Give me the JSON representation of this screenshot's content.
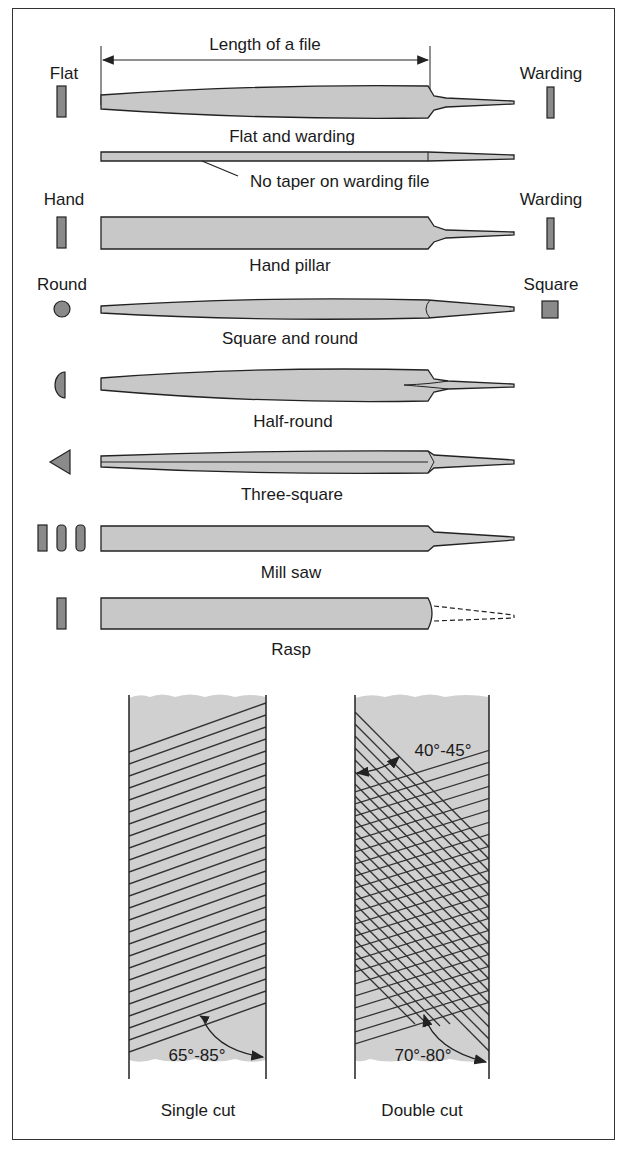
{
  "figure": {
    "title_dimension": "Length of a file",
    "files": [
      {
        "name": "Flat and warding",
        "left_profile": "Flat",
        "right_profile": "Warding"
      },
      {
        "name": "No taper on warding file",
        "annotation": true
      },
      {
        "name": "Hand pillar",
        "left_profile": "Hand",
        "right_profile": "Warding"
      },
      {
        "name": "Square and round",
        "left_profile": "Round",
        "right_profile": "Square"
      },
      {
        "name": "Half-round"
      },
      {
        "name": "Three-square"
      },
      {
        "name": "Mill saw"
      },
      {
        "name": "Rasp"
      }
    ],
    "cuts": [
      {
        "name": "Single cut",
        "angle": "65°-85°"
      },
      {
        "name": "Double cut",
        "angle_top": "40°-45°",
        "angle_bottom": "70°-80°"
      }
    ]
  }
}
